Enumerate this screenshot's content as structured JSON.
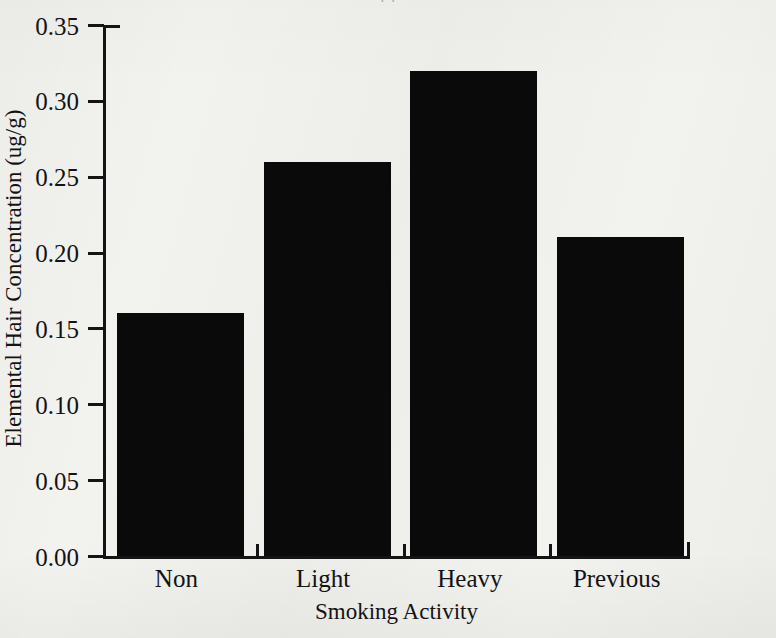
{
  "figure": {
    "title_remnant": "( )",
    "background_color": "#f2f2ef",
    "ink_color": "#0a0a0a"
  },
  "chart_data": {
    "type": "bar",
    "title": "",
    "categories": [
      "Non",
      "Light",
      "Heavy",
      "Previous"
    ],
    "values": [
      0.16,
      0.26,
      0.32,
      0.21
    ],
    "series": [
      {
        "name": "Elemental Hair Concentration",
        "values": [
          0.16,
          0.26,
          0.32,
          0.21
        ]
      }
    ],
    "xlabel": "Smoking Activity",
    "ylabel": "Elemental Hair Concentration (ug/g)",
    "ylim": [
      0.0,
      0.35
    ],
    "ytick_labels": [
      "0.00",
      "0.05",
      "0.10",
      "0.15",
      "0.20",
      "0.25",
      "0.30",
      "0.35"
    ],
    "ytick_values": [
      0.0,
      0.05,
      0.1,
      0.15,
      0.2,
      0.25,
      0.3,
      0.35
    ],
    "grid": false,
    "legend": false,
    "bar_color": "#0a0a0a",
    "axis_style": "L-shaped frame with outward ticks"
  }
}
